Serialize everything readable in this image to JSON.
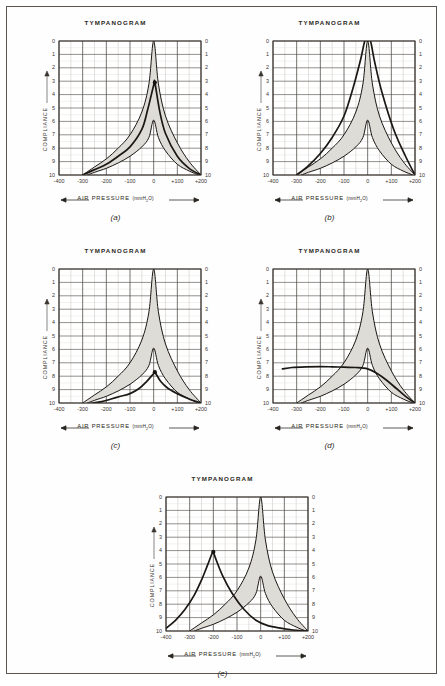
{
  "figure": {
    "panels": [
      {
        "id": "a",
        "caption": "(a)",
        "title": "TYMPANOGRAM",
        "ylabel": "COMPLIANCE",
        "xlabel_text": "AIR PRESSURE",
        "xlabel_unit": "(mmH2O)",
        "xlabel_unit_pre": "(mmH",
        "xlabel_unit_sub": "2",
        "xlabel_unit_post": "O)",
        "xticks": [
          "-400",
          "-300",
          "-200",
          "-100",
          "0",
          "+100",
          "+200"
        ],
        "yticks": [
          "0",
          "1",
          "2",
          "3",
          "4",
          "5",
          "6",
          "7",
          "8",
          "9",
          "10"
        ]
      },
      {
        "id": "b",
        "caption": "(b)",
        "title": "TYMPANOGRAM",
        "ylabel": "COMPLIANCE",
        "xlabel_text": "AIR PRESSURE",
        "xlabel_unit": "(mmH2O)",
        "xlabel_unit_pre": "(mmH",
        "xlabel_unit_sub": "2",
        "xlabel_unit_post": "O)",
        "xticks": [
          "-400",
          "-300",
          "-200",
          "-100",
          "0",
          "+100",
          "+200"
        ],
        "yticks": [
          "0",
          "1",
          "2",
          "3",
          "4",
          "5",
          "6",
          "7",
          "8",
          "9",
          "10"
        ]
      },
      {
        "id": "c",
        "caption": "(c)",
        "title": "TYMPANOGRAM",
        "ylabel": "COMPLIANCE",
        "xlabel_text": "AIR PRESSURE",
        "xlabel_unit": "(mmH2O)",
        "xlabel_unit_pre": "(mmH",
        "xlabel_unit_sub": "2",
        "xlabel_unit_post": "O)",
        "xticks": [
          "-400",
          "-300",
          "-200",
          "-100",
          "0",
          "+100",
          "+200"
        ],
        "yticks": [
          "0",
          "1",
          "2",
          "3",
          "4",
          "5",
          "6",
          "7",
          "8",
          "9",
          "10"
        ]
      },
      {
        "id": "d",
        "caption": "(d)",
        "title": "TYMPANOGRAM",
        "ylabel": "COMPLIANCE",
        "xlabel_text": "AIR PRESSURE",
        "xlabel_unit": "(mmH2O)",
        "xlabel_unit_pre": "(mmH",
        "xlabel_unit_sub": "2",
        "xlabel_unit_post": "O)",
        "xticks": [
          "-400",
          "-300",
          "-200",
          "-100",
          "0",
          "+100",
          "+200"
        ],
        "yticks": [
          "0",
          "1",
          "2",
          "3",
          "4",
          "5",
          "6",
          "7",
          "8",
          "9",
          "10"
        ]
      },
      {
        "id": "e",
        "caption": "(e)",
        "title": "TYMPANOGRAM",
        "ylabel": "COMPLIANCE",
        "xlabel_text": "AIR PRESSURE",
        "xlabel_unit": "(mmH2O)",
        "xlabel_unit_pre": "(mmH",
        "xlabel_unit_sub": "2",
        "xlabel_unit_post": "O)",
        "xticks": [
          "-400",
          "-300",
          "-200",
          "-100",
          "0",
          "+100",
          "+200"
        ],
        "yticks": [
          "0",
          "1",
          "2",
          "3",
          "4",
          "5",
          "6",
          "7",
          "8",
          "9",
          "10"
        ]
      }
    ]
  },
  "style": {
    "curve_color": "#1a1714",
    "shade_color": "#dedcd6",
    "grid_major": "#4a4540",
    "grid_minor": "#b9b4ae",
    "frame_color": "#5a5550",
    "marker_color": "#161310"
  },
  "chart_data": [
    {
      "type": "line",
      "panel": "a",
      "title": "TYMPANOGRAM",
      "xlabel": "AIR PRESSURE (mmH2O)",
      "ylabel": "COMPLIANCE",
      "xlim": [
        -400,
        200
      ],
      "ylim": [
        10,
        0
      ],
      "y_inverted": true,
      "xticks": [
        -400,
        -300,
        -200,
        -100,
        0,
        100,
        200
      ],
      "yticks": [
        0,
        1,
        2,
        3,
        4,
        5,
        6,
        7,
        8,
        9,
        10
      ],
      "grid": true,
      "x_minor_step": 50,
      "legend": "none",
      "annotation": "Normal tympanogram: peak compliance 3.1 at 0 mmH2O, within shaded normal range",
      "marker": {
        "x": 5,
        "y": 3.1
      },
      "series": [
        {
          "name": "normal-range-upper",
          "role": "shade-boundary",
          "x": [
            -300,
            -250,
            -200,
            -150,
            -100,
            -50,
            -20,
            0,
            20,
            50,
            100,
            150,
            200
          ],
          "values": [
            10.0,
            9.4,
            8.8,
            8.0,
            7.0,
            5.3,
            3.2,
            0.0,
            3.2,
            5.6,
            7.6,
            9.0,
            10.0
          ]
        },
        {
          "name": "normal-range-lower",
          "role": "shade-boundary",
          "x": [
            -280,
            -250,
            -200,
            -150,
            -100,
            -50,
            -20,
            0,
            20,
            50,
            100,
            150,
            190
          ],
          "values": [
            10.0,
            9.8,
            9.5,
            9.1,
            8.6,
            7.9,
            7.2,
            5.9,
            7.2,
            8.2,
            9.2,
            9.7,
            10.0
          ]
        },
        {
          "name": "patient-tympanogram",
          "role": "measured",
          "x": [
            -300,
            -250,
            -200,
            -150,
            -100,
            -50,
            -25,
            0,
            5,
            25,
            50,
            100,
            150,
            200
          ],
          "values": [
            10.0,
            9.6,
            9.2,
            8.6,
            7.9,
            6.6,
            5.1,
            3.3,
            3.1,
            5.2,
            6.9,
            8.6,
            9.5,
            10.0
          ]
        }
      ]
    },
    {
      "type": "line",
      "panel": "b",
      "title": "TYMPANOGRAM",
      "xlabel": "AIR PRESSURE (mmH2O)",
      "ylabel": "COMPLIANCE",
      "xlim": [
        -400,
        200
      ],
      "ylim": [
        10,
        0
      ],
      "y_inverted": true,
      "xticks": [
        -400,
        -300,
        -200,
        -100,
        0,
        100,
        200
      ],
      "yticks": [
        0,
        1,
        2,
        3,
        4,
        5,
        6,
        7,
        8,
        9,
        10
      ],
      "grid": true,
      "x_minor_step": 50,
      "legend": "none",
      "annotation": "Hypercompliant (flaccid) tympanogram: very tall narrow peak exceeding scale at 0 mmH2O",
      "marker": null,
      "series": [
        {
          "name": "normal-range-upper",
          "role": "shade-boundary",
          "x": [
            -300,
            -250,
            -200,
            -150,
            -100,
            -50,
            -20,
            0,
            20,
            50,
            100,
            150,
            200
          ],
          "values": [
            10.0,
            9.4,
            8.8,
            8.0,
            7.0,
            5.3,
            3.2,
            0.0,
            3.2,
            5.6,
            7.6,
            9.0,
            10.0
          ]
        },
        {
          "name": "normal-range-lower",
          "role": "shade-boundary",
          "x": [
            -280,
            -250,
            -200,
            -150,
            -100,
            -50,
            -20,
            0,
            20,
            50,
            100,
            150,
            190
          ],
          "values": [
            10.0,
            9.8,
            9.5,
            9.1,
            8.6,
            7.9,
            7.2,
            5.9,
            7.2,
            8.2,
            9.2,
            9.7,
            10.0
          ]
        },
        {
          "name": "patient-tympanogram",
          "role": "measured",
          "x": [
            -300,
            -250,
            -200,
            -150,
            -100,
            -60,
            -30,
            -12,
            0,
            12,
            30,
            60,
            110,
            160,
            200
          ],
          "values": [
            10.0,
            9.3,
            8.4,
            7.2,
            5.6,
            3.4,
            1.4,
            0.0,
            0.0,
            0.0,
            1.6,
            3.8,
            6.6,
            8.6,
            10.0
          ]
        }
      ]
    },
    {
      "type": "line",
      "panel": "c",
      "title": "TYMPANOGRAM",
      "xlabel": "AIR PRESSURE (mmH2O)",
      "ylabel": "COMPLIANCE",
      "xlim": [
        -400,
        200
      ],
      "ylim": [
        10,
        0
      ],
      "y_inverted": true,
      "xticks": [
        -400,
        -300,
        -200,
        -100,
        0,
        100,
        200
      ],
      "yticks": [
        0,
        1,
        2,
        3,
        4,
        5,
        6,
        7,
        8,
        9,
        10
      ],
      "grid": true,
      "x_minor_step": 50,
      "legend": "none",
      "annotation": "Reduced compliance (stiff) tympanogram: shallow peak 7.7 at 0 mmH2O, below normal range",
      "marker": {
        "x": 5,
        "y": 7.7
      },
      "series": [
        {
          "name": "normal-range-upper",
          "role": "shade-boundary",
          "x": [
            -300,
            -250,
            -200,
            -150,
            -100,
            -50,
            -20,
            0,
            20,
            50,
            100,
            150,
            200
          ],
          "values": [
            10.0,
            9.4,
            8.8,
            8.0,
            7.0,
            5.3,
            3.2,
            0.0,
            3.2,
            5.6,
            7.6,
            9.0,
            10.0
          ]
        },
        {
          "name": "normal-range-lower",
          "role": "shade-boundary",
          "x": [
            -280,
            -250,
            -200,
            -150,
            -100,
            -50,
            -20,
            0,
            20,
            50,
            100,
            150,
            190
          ],
          "values": [
            10.0,
            9.8,
            9.5,
            9.1,
            8.6,
            7.9,
            7.2,
            5.9,
            7.2,
            8.2,
            9.2,
            9.7,
            10.0
          ]
        },
        {
          "name": "patient-tympanogram",
          "role": "measured",
          "x": [
            -260,
            -220,
            -180,
            -140,
            -100,
            -60,
            -30,
            0,
            5,
            30,
            60,
            100,
            150,
            200
          ],
          "values": [
            10.0,
            9.9,
            9.7,
            9.5,
            9.3,
            8.9,
            8.4,
            7.8,
            7.7,
            8.4,
            8.9,
            9.3,
            9.7,
            10.0
          ]
        }
      ]
    },
    {
      "type": "line",
      "panel": "d",
      "title": "TYMPANOGRAM",
      "xlabel": "AIR PRESSURE (mmH2O)",
      "ylabel": "COMPLIANCE",
      "xlim": [
        -400,
        200
      ],
      "ylim": [
        10,
        0
      ],
      "y_inverted": true,
      "xticks": [
        -400,
        -300,
        -200,
        -100,
        0,
        100,
        200
      ],
      "yticks": [
        0,
        1,
        2,
        3,
        4,
        5,
        6,
        7,
        8,
        9,
        10
      ],
      "grid": true,
      "x_minor_step": 50,
      "legend": "none",
      "annotation": "Flat (type B) tympanogram: no discernible peak, compliance ~7.4 across pressure range",
      "marker": null,
      "series": [
        {
          "name": "normal-range-upper",
          "role": "shade-boundary",
          "x": [
            -300,
            -250,
            -200,
            -150,
            -100,
            -50,
            -20,
            0,
            20,
            50,
            100,
            150,
            200
          ],
          "values": [
            10.0,
            9.4,
            8.8,
            8.0,
            7.0,
            5.3,
            3.2,
            0.0,
            3.2,
            5.6,
            7.6,
            9.0,
            10.0
          ]
        },
        {
          "name": "normal-range-lower",
          "role": "shade-boundary",
          "x": [
            -280,
            -250,
            -200,
            -150,
            -100,
            -50,
            -20,
            0,
            20,
            50,
            100,
            150,
            190
          ],
          "values": [
            10.0,
            9.8,
            9.5,
            9.1,
            8.6,
            7.9,
            7.2,
            5.9,
            7.2,
            8.2,
            9.2,
            9.7,
            10.0
          ]
        },
        {
          "name": "patient-tympanogram",
          "role": "measured",
          "x": [
            -360,
            -320,
            -260,
            -200,
            -150,
            -100,
            -50,
            0,
            40,
            80,
            120,
            160,
            200
          ],
          "values": [
            7.45,
            7.35,
            7.3,
            7.28,
            7.3,
            7.33,
            7.35,
            7.45,
            7.8,
            8.3,
            8.9,
            9.5,
            10.0
          ]
        }
      ]
    },
    {
      "type": "line",
      "panel": "e",
      "title": "TYMPANOGRAM",
      "xlabel": "AIR PRESSURE (mmH2O)",
      "ylabel": "COMPLIANCE",
      "xlim": [
        -400,
        200
      ],
      "ylim": [
        10,
        0
      ],
      "y_inverted": true,
      "xticks": [
        -400,
        -300,
        -200,
        -100,
        0,
        100,
        200
      ],
      "yticks": [
        0,
        1,
        2,
        3,
        4,
        5,
        6,
        7,
        8,
        9,
        10
      ],
      "grid": true,
      "x_minor_step": 50,
      "legend": "none",
      "annotation": "Negative middle-ear pressure (type C): peak compliance 4.1 shifted to -200 mmH2O",
      "marker": {
        "x": -200,
        "y": 4.1
      },
      "series": [
        {
          "name": "normal-range-upper",
          "role": "shade-boundary",
          "x": [
            -300,
            -250,
            -200,
            -150,
            -100,
            -50,
            -20,
            0,
            20,
            50,
            100,
            150,
            200
          ],
          "values": [
            10.0,
            9.4,
            8.8,
            8.0,
            7.0,
            5.3,
            3.2,
            0.0,
            3.2,
            5.6,
            7.6,
            9.0,
            10.0
          ]
        },
        {
          "name": "normal-range-lower",
          "role": "shade-boundary",
          "x": [
            -280,
            -250,
            -200,
            -150,
            -100,
            -50,
            -20,
            0,
            20,
            50,
            100,
            150,
            190
          ],
          "values": [
            10.0,
            9.8,
            9.5,
            9.1,
            8.6,
            7.9,
            7.2,
            5.9,
            7.2,
            8.2,
            9.2,
            9.7,
            10.0
          ]
        },
        {
          "name": "patient-tympanogram",
          "role": "measured",
          "x": [
            -400,
            -360,
            -320,
            -280,
            -250,
            -225,
            -205,
            -200,
            -190,
            -160,
            -120,
            -70,
            -20,
            30,
            90,
            150,
            200
          ],
          "values": [
            9.8,
            9.2,
            8.4,
            7.3,
            6.2,
            5.1,
            4.2,
            4.1,
            4.6,
            5.9,
            7.2,
            8.4,
            9.2,
            9.6,
            9.8,
            9.95,
            10.0
          ]
        }
      ]
    }
  ]
}
